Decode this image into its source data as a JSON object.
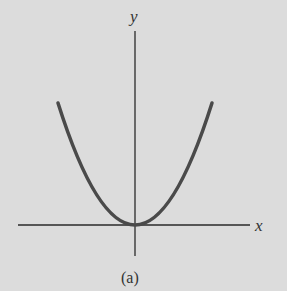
{
  "figure": {
    "caption": "(a)",
    "x_axis_label": "x",
    "y_axis_label": "y",
    "curve": "parabola opening upward, vertex at origin",
    "colors": {
      "background": "#dcdcdc",
      "axes": "#2a2a2a",
      "curve": "#4a4a4a"
    }
  }
}
